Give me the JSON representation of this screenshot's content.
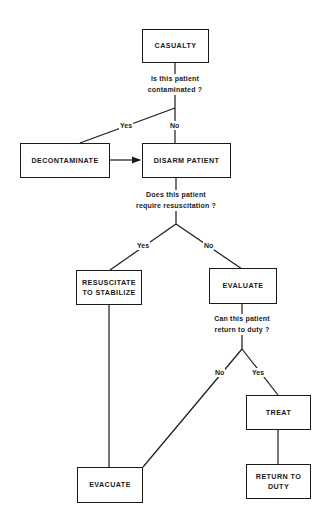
{
  "nodes": {
    "casualty": "CASUALTY",
    "decontaminate": "DECONTAMINATE",
    "disarm": "DISARM PATIENT",
    "resuscitate": "RESUSCITATE\nTO STABILIZE",
    "evaluate": "EVALUATE",
    "evacuate": "EVACUATE",
    "treat": "TREAT",
    "return_to_duty": "RETURN TO\nDUTY"
  },
  "questions": {
    "contaminated": "Is this patient\ncontaminated ?",
    "resuscitation": "Does this patient\nrequire resuscitation ?",
    "return_duty": "Can this patient\nreturn to duty ?"
  },
  "edge_labels": {
    "contaminated_yes": "Yes",
    "contaminated_no": "No",
    "resuscitation_yes": "Yes",
    "resuscitation_no": "No",
    "return_duty_no": "No",
    "return_duty_yes": "Yes"
  }
}
